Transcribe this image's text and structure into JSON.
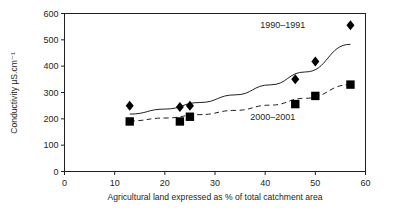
{
  "chart_data": {
    "type": "scatter",
    "title": "",
    "xlabel": "Agricultural land expressed as % of total catchment area",
    "ylabel": "Conductivity µS.cm⁻¹",
    "xlim": [
      0,
      60
    ],
    "ylim": [
      0,
      600
    ],
    "xticks": [
      0,
      10,
      20,
      30,
      40,
      50,
      60
    ],
    "yticks": [
      0,
      100,
      200,
      300,
      400,
      500,
      600
    ],
    "xtick_labels": [
      "0",
      "10",
      "20",
      "30",
      "40",
      "50",
      "60"
    ],
    "ytick_labels": [
      "0",
      "100",
      "200",
      "300",
      "400",
      "500",
      "600"
    ],
    "grid": false,
    "legend_position": "in-plot-annotation",
    "series": [
      {
        "name": "1990–1991",
        "marker": "diamond",
        "color": "#000000",
        "trend_line_style": "solid",
        "x": [
          13,
          23,
          25,
          46,
          50,
          57
        ],
        "y": [
          250,
          245,
          250,
          350,
          418,
          555
        ],
        "trend_x": [
          13,
          20,
          27,
          34,
          41,
          48,
          57
        ],
        "trend_y": [
          218,
          237,
          262,
          291,
          329,
          378,
          483
        ],
        "annotation": "1990–1991",
        "annotation_x": 43.5,
        "annotation_y": 545
      },
      {
        "name": "2000–2001",
        "marker": "square",
        "color": "#000000",
        "trend_line_style": "dashed",
        "x": [
          13,
          23,
          25,
          46,
          50,
          57
        ],
        "y": [
          190,
          190,
          208,
          256,
          287,
          330
        ],
        "trend_x": [
          13,
          20,
          27,
          34,
          41,
          48,
          57
        ],
        "trend_y": [
          192,
          203,
          216,
          232,
          252,
          278,
          330
        ],
        "annotation": "2000–2001",
        "annotation_x": 41.5,
        "annotation_y": 195
      }
    ]
  },
  "figure": {
    "background_color": "#ffffff",
    "axis_color": "#231f20",
    "marker_color": "#000000"
  }
}
